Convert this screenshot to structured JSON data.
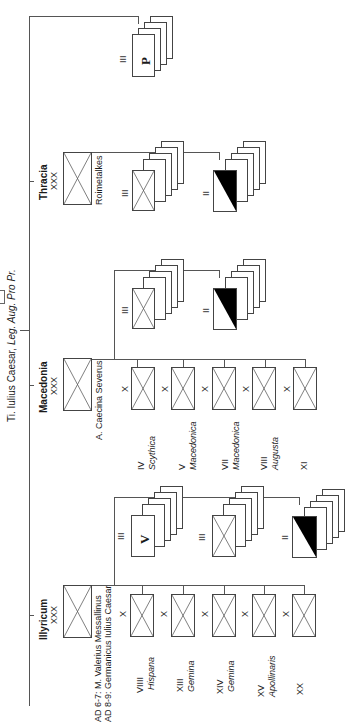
{
  "commander": {
    "label_prefix": "Ti. Iulius Caesar, ",
    "label_title": "Leg. Aug. Pro Pr."
  },
  "armies": [
    {
      "name": "Thracia",
      "size": "XXX",
      "commander": "Roimetalkes",
      "units": [
        {
          "size": "III",
          "type": "infantry"
        },
        {
          "size": "II",
          "type": "light-infantry"
        }
      ]
    },
    {
      "name": "Macedonia",
      "size": "XXX",
      "commander": "A. Caecina Severus",
      "legions": [
        {
          "size": "X",
          "number": "IV",
          "name": "Scythica"
        },
        {
          "size": "X",
          "number": "V",
          "name": "Macedonica"
        },
        {
          "size": "X",
          "number": "VII",
          "name": "Macedonica"
        },
        {
          "size": "X",
          "number": "VIII",
          "name": "Augusta"
        },
        {
          "size": "X",
          "number": "XI",
          "name": ""
        }
      ],
      "units": [
        {
          "size": "III",
          "type": "infantry"
        },
        {
          "size": "II",
          "type": "light-infantry"
        }
      ]
    },
    {
      "name": "Illyricum",
      "size": "XXX",
      "commander_line1": "AD 6-7: M. Valerius Messallinus",
      "commander_line2": "AD 8-9: Germanicus Iulius Caesar",
      "legions": [
        {
          "size": "X",
          "number": "VIIII",
          "name": "Hispana"
        },
        {
          "size": "X",
          "number": "XIII",
          "name": "Gemina"
        },
        {
          "size": "X",
          "number": "XIV",
          "name": "Gemina"
        },
        {
          "size": "X",
          "number": "XV",
          "name": "Apollinaris"
        },
        {
          "size": "X",
          "number": "XX",
          "name": ""
        }
      ],
      "units": [
        {
          "size": "III",
          "type": "veterans",
          "letter": "V"
        },
        {
          "size": "III",
          "type": "infantry"
        },
        {
          "size": "II",
          "type": "light-infantry"
        }
      ]
    }
  ],
  "reserve": {
    "size": "III",
    "letter": "P"
  },
  "colors": {
    "line": "#555555",
    "fill": "#000000",
    "paper": "#ffffff"
  }
}
